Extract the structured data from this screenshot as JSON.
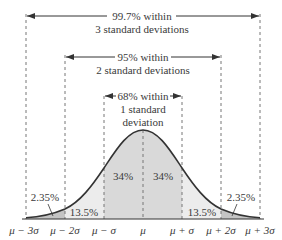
{
  "diagram": {
    "spans": [
      {
        "line1": "99.7% within",
        "line2": "3 standard deviations"
      },
      {
        "line1": "95% within",
        "line2": "2 standard deviations"
      },
      {
        "line1": "68% within",
        "line2": "1 standard",
        "line3": "deviation"
      }
    ],
    "regions": {
      "inner_left": "34%",
      "inner_right": "34%",
      "middle_left": "13.5%",
      "middle_right": "13.5%",
      "outer_left": "2.35%",
      "outer_right": "2.35%"
    },
    "axis_ticks": [
      "μ − 3σ",
      "μ − 2σ",
      "μ − σ",
      "μ",
      "μ + σ",
      "μ + 2σ",
      "μ + 3σ"
    ],
    "colors": {
      "inner_fill": "#d9d9d9",
      "middle_fill": "#ececec",
      "outer_fill": "#c4c4c4",
      "curve": "#333333",
      "dashed": "#777777"
    }
  }
}
